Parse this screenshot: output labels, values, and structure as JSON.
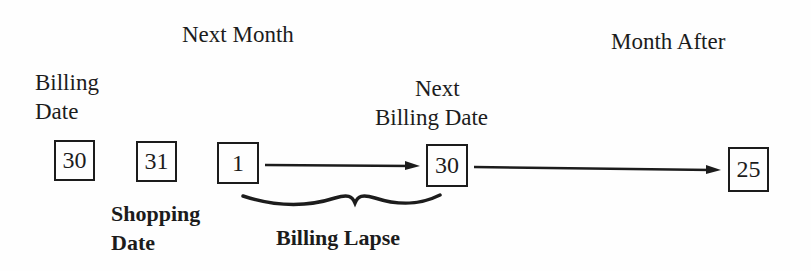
{
  "headings": {
    "next_month": "Next Month",
    "month_after": "Month After"
  },
  "labels": {
    "billing_date_line1": "Billing",
    "billing_date_line2": "Date",
    "next_billing_line1": "Next",
    "next_billing_line2": "Billing Date",
    "shopping_date_line1": "Shopping",
    "shopping_date_line2": "Date",
    "billing_lapse": "Billing Lapse"
  },
  "boxes": [
    {
      "id": "billing-date",
      "value": "30"
    },
    {
      "id": "shopping-date",
      "value": "31"
    },
    {
      "id": "next-month-start",
      "value": "1"
    },
    {
      "id": "next-billing-date",
      "value": "30"
    },
    {
      "id": "month-after-date",
      "value": "25"
    }
  ],
  "arrows": [
    {
      "from": "1",
      "to": "30"
    },
    {
      "from": "30",
      "to": "25"
    }
  ],
  "colors": {
    "ink": "#1c1c1c",
    "paper": "#fefefe"
  }
}
